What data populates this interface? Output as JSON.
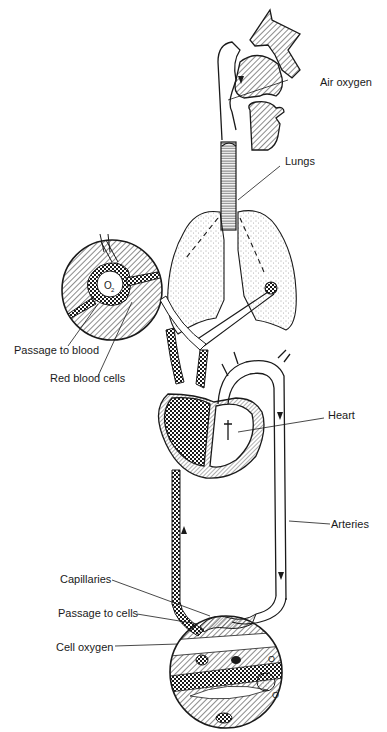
{
  "figure": {
    "labels": {
      "air_oxygen": "Air oxygen",
      "lungs": "Lungs",
      "passage_to_blood": "Passage to blood",
      "red_blood_cells": "Red blood cells",
      "heart": "Heart",
      "arteries": "Arteries",
      "capillaries": "Capillaries",
      "passage_to_cells": "Passage to cells",
      "cell_oxygen": "Cell oxygen"
    },
    "inset_symbols": {
      "alveolus_o2": "O",
      "alveolus_o2_sub": "2",
      "cell_o2_a": "O",
      "cell_o2_b": "O"
    },
    "colors": {
      "ink": "#1a1a1a",
      "paper": "#ffffff"
    }
  }
}
